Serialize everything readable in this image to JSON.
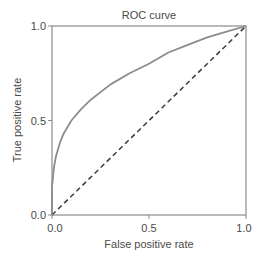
{
  "chart_data": {
    "type": "line",
    "title": "ROC curve",
    "xlabel": "False positive rate",
    "ylabel": "True positive rate",
    "xlim": [
      0.0,
      1.0
    ],
    "ylim": [
      0.0,
      1.0
    ],
    "x_ticks": [
      "0.0",
      "0.5",
      "1.0"
    ],
    "y_ticks": [
      "0.0",
      "0.5",
      "1.0"
    ],
    "grid": false,
    "legend": null,
    "series": [
      {
        "name": "ROC curve",
        "style": "solid",
        "color": "#8c8c8c",
        "x": [
          0.0,
          0.0,
          0.005,
          0.01,
          0.02,
          0.04,
          0.06,
          0.1,
          0.15,
          0.2,
          0.3,
          0.4,
          0.5,
          0.6,
          0.7,
          0.8,
          0.9,
          1.0
        ],
        "y": [
          0.0,
          0.15,
          0.2,
          0.25,
          0.31,
          0.38,
          0.43,
          0.5,
          0.56,
          0.61,
          0.69,
          0.75,
          0.8,
          0.86,
          0.9,
          0.94,
          0.97,
          1.0
        ]
      },
      {
        "name": "Chance",
        "style": "dashed",
        "color": "#3a3a3a",
        "x": [
          0.0,
          1.0
        ],
        "y": [
          0.0,
          1.0
        ]
      }
    ]
  },
  "colors": {
    "axis": "#8a8a8a",
    "text": "#4a4a4a",
    "roc_curve": "#8c8c8c",
    "diagonal": "#3a3a3a"
  }
}
